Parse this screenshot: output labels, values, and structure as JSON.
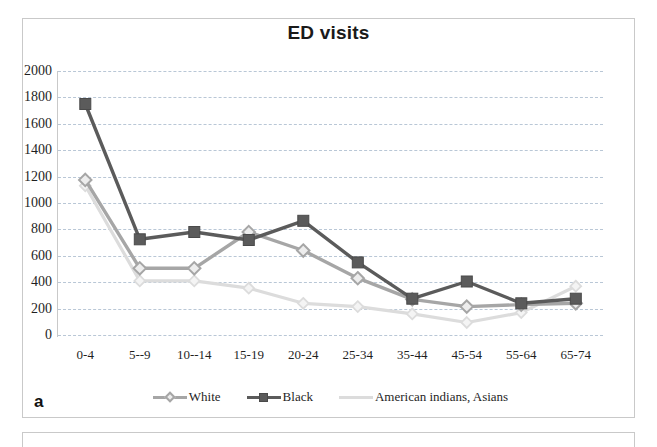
{
  "panel": {
    "letter": "a"
  },
  "chart_data": {
    "type": "line",
    "title": "ED visits",
    "xlabel": "",
    "ylabel": "",
    "ylim": [
      0,
      2000
    ],
    "ytick_step": 200,
    "yticks": [
      2000,
      1800,
      1600,
      1400,
      1200,
      1000,
      800,
      600,
      400,
      200,
      0
    ],
    "grid": true,
    "legend_position": "bottom",
    "categories": [
      "0-4",
      "5--9",
      "10--14",
      "15-19",
      "20-24",
      "25-34",
      "35-44",
      "45-54",
      "55-64",
      "65-74"
    ],
    "series": [
      {
        "name": "White",
        "color": "#a6a6a6",
        "marker": "diamond",
        "values": [
          1175,
          505,
          505,
          780,
          640,
          430,
          270,
          215,
          230,
          240
        ]
      },
      {
        "name": "Black",
        "color": "#5b5b5b",
        "marker": "square",
        "values": [
          1750,
          725,
          780,
          720,
          865,
          550,
          275,
          405,
          240,
          275
        ]
      },
      {
        "name": "American indians, Asians",
        "color": "#dcdcdc",
        "marker": "none",
        "values": [
          1130,
          410,
          410,
          355,
          240,
          215,
          160,
          95,
          170,
          370
        ]
      }
    ]
  },
  "colors": {
    "grid": "#b9c7d6",
    "axis": "#c9c9c9",
    "text": "#1f1f1f",
    "panel_border": "#c9c9c9"
  }
}
